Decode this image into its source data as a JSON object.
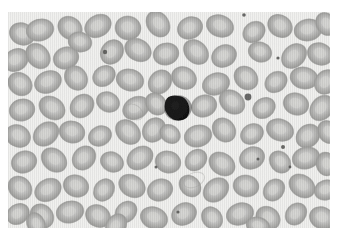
{
  "image": {
    "kind": "micrograph",
    "subject": "peripheral-blood-smear",
    "width": 341,
    "height": 243,
    "field": {
      "x": 8,
      "y": 12,
      "width": 322,
      "height": 216
    },
    "background_color": "#f2f2f0",
    "border_color": "#ffffff",
    "modality": "brightfield-light-microscopy",
    "stain_appearance": "grayscale"
  },
  "palette": {
    "slide_background": "#f2f2f0",
    "erythrocyte_rim": "#9e9e9c",
    "erythrocyte_mid": "#b4b4b2",
    "erythrocyte_pallor": "#d8d8d6",
    "leukocyte_nucleus": "#141414",
    "leukocyte_edge": "#2a2a2a",
    "platelet": "#5a5a58",
    "page_white": "#ffffff"
  },
  "objects": {
    "leukocyte": {
      "label": "leukocyte-nucleus",
      "cx": 170,
      "cy": 96,
      "rx": 13,
      "ry": 12,
      "rotation": -10
    },
    "platelets": [
      {
        "cx": 240,
        "cy": 85,
        "r": 3.4
      },
      {
        "cx": 97,
        "cy": 40,
        "r": 2.2
      },
      {
        "cx": 275,
        "cy": 135,
        "r": 2.0
      },
      {
        "cx": 236,
        "cy": 3,
        "r": 1.8
      },
      {
        "cx": 270,
        "cy": 46,
        "r": 1.6
      },
      {
        "cx": 250,
        "cy": 147,
        "r": 1.5
      },
      {
        "cx": 168,
        "cy": 612,
        "r": 1.4
      },
      {
        "cx": 148,
        "cy": 155,
        "r": 1.5
      },
      {
        "cx": 170,
        "cy": 200,
        "r": 1.6
      },
      {
        "cx": 282,
        "cy": 155,
        "r": 1.4
      }
    ],
    "erythrocytes": [
      {
        "cx": 14,
        "cy": 22,
        "rx": 13,
        "ry": 11,
        "rot": 25
      },
      {
        "cx": 32,
        "cy": 18,
        "rx": 14,
        "ry": 11,
        "rot": -15
      },
      {
        "cx": 62,
        "cy": 16,
        "rx": 13,
        "ry": 11,
        "rot": 40
      },
      {
        "cx": 90,
        "cy": 14,
        "rx": 14,
        "ry": 11,
        "rot": -30
      },
      {
        "cx": 120,
        "cy": 16,
        "rx": 13,
        "ry": 12,
        "rot": 10
      },
      {
        "cx": 150,
        "cy": 12,
        "rx": 14,
        "ry": 11,
        "rot": 55
      },
      {
        "cx": 182,
        "cy": 16,
        "rx": 13,
        "ry": 11,
        "rot": -25
      },
      {
        "cx": 212,
        "cy": 14,
        "rx": 14,
        "ry": 11,
        "rot": 20
      },
      {
        "cx": 246,
        "cy": 20,
        "rx": 12,
        "ry": 10,
        "rot": -40
      },
      {
        "cx": 272,
        "cy": 14,
        "rx": 13,
        "ry": 11,
        "rot": 35
      },
      {
        "cx": 300,
        "cy": 18,
        "rx": 14,
        "ry": 11,
        "rot": -10
      },
      {
        "cx": 318,
        "cy": 12,
        "rx": 12,
        "ry": 10,
        "rot": 60
      },
      {
        "cx": 8,
        "cy": 48,
        "rx": 13,
        "ry": 11,
        "rot": -35
      },
      {
        "cx": 30,
        "cy": 44,
        "rx": 14,
        "ry": 11,
        "rot": 50
      },
      {
        "cx": 58,
        "cy": 46,
        "rx": 13,
        "ry": 11,
        "rot": -20
      },
      {
        "cx": 72,
        "cy": 30,
        "rx": 12,
        "ry": 10,
        "rot": 15
      },
      {
        "cx": 104,
        "cy": 40,
        "rx": 13,
        "ry": 11,
        "rot": -55
      },
      {
        "cx": 130,
        "cy": 38,
        "rx": 14,
        "ry": 11,
        "rot": 30
      },
      {
        "cx": 158,
        "cy": 42,
        "rx": 13,
        "ry": 11,
        "rot": -15
      },
      {
        "cx": 188,
        "cy": 40,
        "rx": 14,
        "ry": 11,
        "rot": 45
      },
      {
        "cx": 216,
        "cy": 44,
        "rx": 13,
        "ry": 11,
        "rot": -30
      },
      {
        "cx": 252,
        "cy": 40,
        "rx": 12,
        "ry": 10,
        "rot": 20
      },
      {
        "cx": 286,
        "cy": 44,
        "rx": 14,
        "ry": 11,
        "rot": -45
      },
      {
        "cx": 312,
        "cy": 42,
        "rx": 13,
        "ry": 11,
        "rot": 25
      },
      {
        "cx": 12,
        "cy": 72,
        "rx": 13,
        "ry": 11,
        "rot": 40
      },
      {
        "cx": 40,
        "cy": 70,
        "rx": 14,
        "ry": 11,
        "rot": -25
      },
      {
        "cx": 68,
        "cy": 66,
        "rx": 13,
        "ry": 11,
        "rot": 55
      },
      {
        "cx": 96,
        "cy": 64,
        "rx": 12,
        "ry": 10,
        "rot": -35
      },
      {
        "cx": 122,
        "cy": 68,
        "rx": 14,
        "ry": 11,
        "rot": 15
      },
      {
        "cx": 152,
        "cy": 70,
        "rx": 13,
        "ry": 11,
        "rot": -50
      },
      {
        "cx": 176,
        "cy": 66,
        "rx": 13,
        "ry": 11,
        "rot": 30
      },
      {
        "cx": 208,
        "cy": 72,
        "rx": 14,
        "ry": 11,
        "rot": -20
      },
      {
        "cx": 238,
        "cy": 66,
        "rx": 13,
        "ry": 11,
        "rot": 45
      },
      {
        "cx": 268,
        "cy": 70,
        "rx": 12,
        "ry": 10,
        "rot": -40
      },
      {
        "cx": 296,
        "cy": 66,
        "rx": 14,
        "ry": 11,
        "rot": 10
      },
      {
        "cx": 318,
        "cy": 70,
        "rx": 13,
        "ry": 11,
        "rot": -55
      },
      {
        "cx": 14,
        "cy": 98,
        "rx": 13,
        "ry": 11,
        "rot": -15
      },
      {
        "cx": 44,
        "cy": 96,
        "rx": 14,
        "ry": 11,
        "rot": 35
      },
      {
        "cx": 74,
        "cy": 94,
        "rx": 13,
        "ry": 11,
        "rot": -45
      },
      {
        "cx": 100,
        "cy": 90,
        "rx": 12,
        "ry": 10,
        "rot": 25
      },
      {
        "cx": 128,
        "cy": 96,
        "rx": 14,
        "ry": 11,
        "rot": -30
      },
      {
        "cx": 148,
        "cy": 92,
        "rx": 12,
        "ry": 10,
        "rot": 50
      },
      {
        "cx": 196,
        "cy": 94,
        "rx": 13,
        "ry": 11,
        "rot": -20
      },
      {
        "cx": 224,
        "cy": 90,
        "rx": 14,
        "ry": 11,
        "rot": 40
      },
      {
        "cx": 256,
        "cy": 96,
        "rx": 12,
        "ry": 10,
        "rot": -35
      },
      {
        "cx": 288,
        "cy": 92,
        "rx": 13,
        "ry": 11,
        "rot": 20
      },
      {
        "cx": 314,
        "cy": 96,
        "rx": 14,
        "ry": 11,
        "rot": -50
      },
      {
        "cx": 10,
        "cy": 124,
        "rx": 13,
        "ry": 11,
        "rot": 30
      },
      {
        "cx": 38,
        "cy": 122,
        "rx": 14,
        "ry": 11,
        "rot": -40
      },
      {
        "cx": 64,
        "cy": 120,
        "rx": 13,
        "ry": 11,
        "rot": 15
      },
      {
        "cx": 92,
        "cy": 124,
        "rx": 12,
        "ry": 10,
        "rot": -25
      },
      {
        "cx": 120,
        "cy": 120,
        "rx": 14,
        "ry": 11,
        "rot": 45
      },
      {
        "cx": 146,
        "cy": 118,
        "rx": 13,
        "ry": 11,
        "rot": -55
      },
      {
        "cx": 162,
        "cy": 122,
        "rx": 11,
        "ry": 9,
        "rot": 35
      },
      {
        "cx": 190,
        "cy": 124,
        "rx": 14,
        "ry": 11,
        "rot": -15
      },
      {
        "cx": 216,
        "cy": 118,
        "rx": 13,
        "ry": 11,
        "rot": 50
      },
      {
        "cx": 244,
        "cy": 122,
        "rx": 12,
        "ry": 10,
        "rot": -30
      },
      {
        "cx": 272,
        "cy": 118,
        "rx": 14,
        "ry": 11,
        "rot": 20
      },
      {
        "cx": 300,
        "cy": 124,
        "rx": 13,
        "ry": 11,
        "rot": -45
      },
      {
        "cx": 320,
        "cy": 120,
        "rx": 12,
        "ry": 10,
        "rot": 60
      },
      {
        "cx": 16,
        "cy": 150,
        "rx": 13,
        "ry": 11,
        "rot": -20
      },
      {
        "cx": 46,
        "cy": 148,
        "rx": 14,
        "ry": 11,
        "rot": 40
      },
      {
        "cx": 76,
        "cy": 146,
        "rx": 13,
        "ry": 11,
        "rot": -50
      },
      {
        "cx": 104,
        "cy": 150,
        "rx": 12,
        "ry": 10,
        "rot": 25
      },
      {
        "cx": 132,
        "cy": 146,
        "rx": 14,
        "ry": 11,
        "rot": -35
      },
      {
        "cx": 160,
        "cy": 150,
        "rx": 13,
        "ry": 11,
        "rot": 15
      },
      {
        "cx": 188,
        "cy": 148,
        "rx": 12,
        "ry": 10,
        "rot": -45
      },
      {
        "cx": 214,
        "cy": 152,
        "rx": 14,
        "ry": 11,
        "rot": 35
      },
      {
        "cx": 244,
        "cy": 146,
        "rx": 13,
        "ry": 11,
        "rot": -25
      },
      {
        "cx": 272,
        "cy": 150,
        "rx": 12,
        "ry": 10,
        "rot": 50
      },
      {
        "cx": 298,
        "cy": 146,
        "rx": 14,
        "ry": 11,
        "rot": -15
      },
      {
        "cx": 318,
        "cy": 152,
        "rx": 12,
        "ry": 10,
        "rot": 80
      },
      {
        "cx": 12,
        "cy": 176,
        "rx": 13,
        "ry": 11,
        "rot": 45
      },
      {
        "cx": 40,
        "cy": 178,
        "rx": 14,
        "ry": 11,
        "rot": -30
      },
      {
        "cx": 68,
        "cy": 174,
        "rx": 13,
        "ry": 11,
        "rot": 20
      },
      {
        "cx": 96,
        "cy": 178,
        "rx": 12,
        "ry": 10,
        "rot": -55
      },
      {
        "cx": 124,
        "cy": 174,
        "rx": 14,
        "ry": 11,
        "rot": 30
      },
      {
        "cx": 152,
        "cy": 178,
        "rx": 13,
        "ry": 11,
        "rot": -20
      },
      {
        "cx": 182,
        "cy": 174,
        "rx": 12,
        "ry": 10,
        "rot": 45
      },
      {
        "cx": 208,
        "cy": 178,
        "rx": 14,
        "ry": 11,
        "rot": -40
      },
      {
        "cx": 238,
        "cy": 174,
        "rx": 13,
        "ry": 11,
        "rot": 10
      },
      {
        "cx": 266,
        "cy": 178,
        "rx": 12,
        "ry": 10,
        "rot": -50
      },
      {
        "cx": 294,
        "cy": 174,
        "rx": 14,
        "ry": 11,
        "rot": 35
      },
      {
        "cx": 318,
        "cy": 178,
        "rx": 12,
        "ry": 10,
        "rot": -20
      },
      {
        "cx": 10,
        "cy": 202,
        "rx": 12,
        "ry": 10,
        "rot": -35
      },
      {
        "cx": 34,
        "cy": 204,
        "rx": 13,
        "ry": 11,
        "rot": 50
      },
      {
        "cx": 62,
        "cy": 200,
        "rx": 14,
        "ry": 11,
        "rot": -15
      },
      {
        "cx": 90,
        "cy": 204,
        "rx": 13,
        "ry": 11,
        "rot": 30
      },
      {
        "cx": 118,
        "cy": 200,
        "rx": 12,
        "ry": 10,
        "rot": -45
      },
      {
        "cx": 146,
        "cy": 206,
        "rx": 14,
        "ry": 11,
        "rot": 20
      },
      {
        "cx": 176,
        "cy": 202,
        "rx": 13,
        "ry": 11,
        "rot": -30
      },
      {
        "cx": 204,
        "cy": 206,
        "rx": 12,
        "ry": 10,
        "rot": 55
      },
      {
        "cx": 232,
        "cy": 202,
        "rx": 14,
        "ry": 11,
        "rot": -20
      },
      {
        "cx": 260,
        "cy": 206,
        "rx": 13,
        "ry": 11,
        "rot": 40
      },
      {
        "cx": 288,
        "cy": 202,
        "rx": 12,
        "ry": 10,
        "rot": -50
      },
      {
        "cx": 314,
        "cy": 206,
        "rx": 13,
        "ry": 11,
        "rot": 25
      },
      {
        "cx": 28,
        "cy": 212,
        "rx": 12,
        "ry": 9,
        "rot": 65
      },
      {
        "cx": 108,
        "cy": 214,
        "rx": 13,
        "ry": 10,
        "rot": -60
      },
      {
        "cx": 250,
        "cy": 214,
        "rx": 12,
        "ry": 9,
        "rot": 15
      }
    ],
    "ghost_cells": [
      {
        "cx": 186,
        "cy": 168,
        "rx": 11,
        "ry": 7,
        "rot": -25
      },
      {
        "cx": 126,
        "cy": 100,
        "rx": 10,
        "ry": 7,
        "rot": 35
      }
    ]
  }
}
